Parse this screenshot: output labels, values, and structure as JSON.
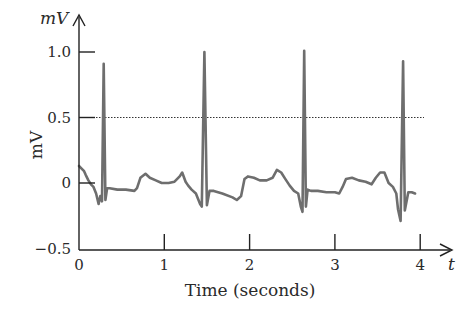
{
  "chart_data": {
    "type": "line",
    "title": "",
    "xlabel": "Time (seconds)",
    "ylabel": "mV",
    "x_axis_var": "t",
    "y_axis_var": "mV",
    "xlim": [
      0,
      4.2
    ],
    "ylim": [
      -0.5,
      1.1
    ],
    "x_ticks": [
      0,
      1,
      2,
      3,
      4
    ],
    "x_tick_labels": [
      "0",
      "1",
      "2",
      "3",
      "4"
    ],
    "y_ticks": [
      -0.5,
      0,
      0.5,
      1.0
    ],
    "y_tick_labels": [
      "−0.5",
      "0",
      "0.5",
      "1.0"
    ],
    "grid": false,
    "legend": null,
    "reference_line": {
      "y": 0.5,
      "style": "dotted",
      "color": "#333333"
    },
    "series": [
      {
        "name": "ECG",
        "color": "#6e6e6e",
        "x": [
          0.0,
          0.03,
          0.06,
          0.08,
          0.11,
          0.14,
          0.17,
          0.2,
          0.23,
          0.25,
          0.27,
          0.29,
          0.31,
          0.33,
          0.36,
          0.45,
          0.55,
          0.65,
          0.68,
          0.72,
          0.78,
          0.83,
          0.9,
          0.97,
          1.05,
          1.12,
          1.18,
          1.21,
          1.25,
          1.28,
          1.32,
          1.37,
          1.42,
          1.44,
          1.47,
          1.5,
          1.53,
          1.58,
          1.68,
          1.8,
          1.85,
          1.9,
          1.94,
          1.98,
          2.05,
          2.12,
          2.2,
          2.27,
          2.32,
          2.37,
          2.42,
          2.47,
          2.52,
          2.57,
          2.6,
          2.62,
          2.64,
          2.66,
          2.68,
          2.72,
          2.8,
          2.9,
          3.0,
          3.05,
          3.09,
          3.13,
          3.2,
          3.28,
          3.36,
          3.43,
          3.48,
          3.53,
          3.58,
          3.63,
          3.68,
          3.72,
          3.74,
          3.77,
          3.8,
          3.82,
          3.86,
          3.9,
          3.94
        ],
        "values": [
          0.13,
          0.11,
          0.09,
          0.06,
          0.02,
          -0.01,
          -0.03,
          -0.08,
          -0.16,
          -0.1,
          -0.14,
          0.91,
          -0.13,
          -0.04,
          -0.04,
          -0.05,
          -0.05,
          -0.06,
          -0.04,
          0.04,
          0.07,
          0.04,
          0.02,
          0.0,
          0.0,
          0.01,
          0.05,
          0.08,
          0.01,
          -0.02,
          -0.05,
          -0.08,
          -0.16,
          -0.18,
          1.0,
          -0.17,
          -0.06,
          -0.06,
          -0.08,
          -0.11,
          -0.13,
          -0.1,
          0.03,
          0.05,
          0.04,
          0.02,
          0.02,
          0.04,
          0.1,
          0.08,
          0.03,
          -0.02,
          -0.06,
          -0.08,
          -0.18,
          -0.22,
          1.01,
          -0.18,
          -0.05,
          -0.06,
          -0.06,
          -0.07,
          -0.07,
          -0.08,
          -0.03,
          0.03,
          0.04,
          0.02,
          0.01,
          -0.01,
          0.04,
          0.08,
          0.08,
          0.0,
          -0.03,
          -0.08,
          -0.2,
          -0.29,
          0.93,
          -0.21,
          -0.07,
          -0.07,
          -0.08
        ]
      }
    ]
  }
}
